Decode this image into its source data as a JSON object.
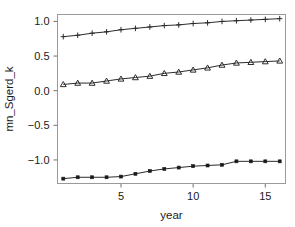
{
  "chart_data": {
    "type": "line",
    "title": "",
    "xlabel": "year",
    "ylabel": "mn_Sgerd_k",
    "x": [
      1,
      2,
      3,
      4,
      5,
      6,
      7,
      8,
      9,
      10,
      11,
      12,
      13,
      14,
      15,
      16
    ],
    "xlim": [
      0.6,
      16.4
    ],
    "ylim": [
      -1.34,
      1.1
    ],
    "xticks": [
      5,
      10,
      15
    ],
    "xtick_labels": [
      "5",
      "10",
      "15"
    ],
    "yticks": [
      1.0,
      0.5,
      0.0,
      -0.5,
      -1.0
    ],
    "ytick_labels": [
      "1.0",
      "0.5",
      "0.0",
      "-0.5",
      "-1.0"
    ],
    "grid": false,
    "legend": "none",
    "series": [
      {
        "name": "upper",
        "marker": "plus",
        "color": "#2b2b2b",
        "values": [
          0.78,
          0.8,
          0.83,
          0.85,
          0.88,
          0.9,
          0.92,
          0.94,
          0.95,
          0.97,
          0.98,
          1.0,
          1.01,
          1.02,
          1.03,
          1.04
        ]
      },
      {
        "name": "middle",
        "marker": "triangle",
        "color": "#2b2b2b",
        "values": [
          0.09,
          0.11,
          0.11,
          0.14,
          0.17,
          0.19,
          0.21,
          0.25,
          0.27,
          0.3,
          0.33,
          0.37,
          0.4,
          0.41,
          0.42,
          0.43
        ]
      },
      {
        "name": "lower",
        "marker": "dot",
        "color": "#1a1a1a",
        "values": [
          -1.27,
          -1.25,
          -1.25,
          -1.25,
          -1.24,
          -1.2,
          -1.16,
          -1.13,
          -1.11,
          -1.09,
          -1.08,
          -1.07,
          -1.02,
          -1.02,
          -1.02,
          -1.02
        ]
      }
    ]
  },
  "figure": {
    "background": "#ffffff",
    "frame_color": "#9a9a9a",
    "text_color": "#1a1a1a"
  }
}
